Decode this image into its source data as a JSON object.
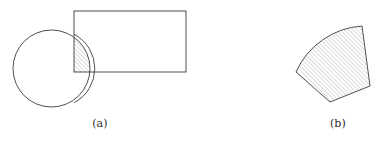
{
  "figure": {
    "background_color": "#ffffff",
    "stroke_color": "#3d3d3d",
    "hatch_color": "#777777",
    "caption_color": "#2b2b2b",
    "panels": [
      {
        "id": "panel-a",
        "caption": "(a)",
        "description": "circle overlapping a rectangle with the intersection hatched",
        "shapes": [
          {
            "name": "circle",
            "type": "circle",
            "cx": 51.5,
            "cy": 68.5,
            "r": 38.5,
            "filled": false
          },
          {
            "name": "rectangle",
            "type": "rect",
            "x": 74,
            "y": 11,
            "width": 112,
            "height": 61,
            "filled": false
          },
          {
            "name": "intersection-region",
            "type": "hatched-lune",
            "hatch_angle_deg": 45,
            "hatch_spacing": 3
          }
        ]
      },
      {
        "id": "panel-b",
        "caption": "(b)",
        "description": "hatched polygon with one curved arc edge",
        "shapes": [
          {
            "name": "arc-polygon",
            "type": "polygon-with-arc",
            "vertices": [
              [
                296,
                72
              ],
              [
                362,
                26
              ],
              [
                370,
                86
              ],
              [
                330,
                102
              ]
            ],
            "arc": {
              "from": [
                296,
                72
              ],
              "to": [
                362,
                26
              ],
              "radius": 78,
              "sweep": "counterclockwise-bulge-outward"
            },
            "hatch_angle_deg": 45,
            "hatch_spacing": 3,
            "filled": true
          }
        ]
      }
    ]
  }
}
